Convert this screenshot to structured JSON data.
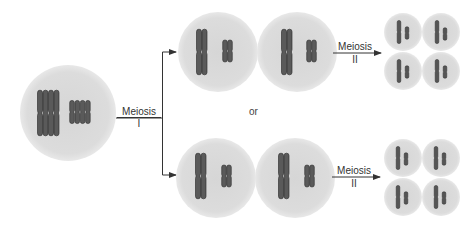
{
  "diagram": {
    "type": "meiosis-chromosome-segregation",
    "labels": {
      "meiosis1_top": "Meiosis",
      "meiosis1_bottom": "I",
      "meiosis2_upper_top": "Meiosis",
      "meiosis2_upper_bottom": "II",
      "meiosis2_lower_top": "Meiosis",
      "meiosis2_lower_bottom": "II",
      "or": "or"
    },
    "colors": {
      "cell_fill": "#d9d9d9",
      "cell_edge": "#ececec",
      "chromosome": "#5a5a5a",
      "chromosome_outline": "#2e2e2e",
      "arrow": "#333333"
    },
    "cells": {
      "parent": {
        "cx": 68,
        "cy": 113,
        "r": 48
      },
      "meiosis1_option_a": [
        {
          "cx": 218,
          "cy": 52,
          "r": 40
        },
        {
          "cx": 297,
          "cy": 52,
          "r": 40
        }
      ],
      "meiosis1_option_b": [
        {
          "cx": 216,
          "cy": 178,
          "r": 40
        },
        {
          "cx": 295,
          "cy": 178,
          "r": 40
        }
      ],
      "meiosis2_option_a": [
        {
          "cx": 403,
          "cy": 32,
          "r": 19
        },
        {
          "cx": 441,
          "cy": 32,
          "r": 19
        },
        {
          "cx": 403,
          "cy": 71,
          "r": 19
        },
        {
          "cx": 441,
          "cy": 71,
          "r": 19
        }
      ],
      "meiosis2_option_b": [
        {
          "cx": 403,
          "cy": 158,
          "r": 19
        },
        {
          "cx": 441,
          "cy": 158,
          "r": 19
        },
        {
          "cx": 403,
          "cy": 197,
          "r": 19
        },
        {
          "cx": 441,
          "cy": 197,
          "r": 19
        }
      ]
    }
  }
}
